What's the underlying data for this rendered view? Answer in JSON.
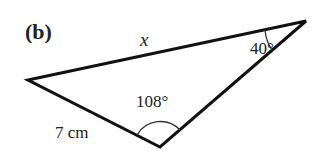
{
  "figure": {
    "part_label": "(b)",
    "side_opposite_label": "x",
    "angle_top_right": "40°",
    "angle_bottom": "108°",
    "side_bottom_left": "7 cm"
  },
  "colors": {
    "stroke": "#111111",
    "text": "#222222",
    "background": "#ffffff"
  }
}
